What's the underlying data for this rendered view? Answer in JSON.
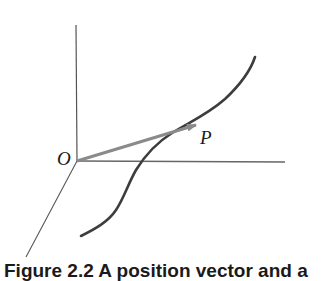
{
  "figure": {
    "origin_label": "O",
    "point_label": "P",
    "caption": "Figure 2.2 A position vector and a",
    "colors": {
      "axes": "#555555",
      "vector": "#8a8a8a",
      "curve": "#3d3d3d",
      "text": "#1a1a1a"
    },
    "elements": {
      "axes": [
        "vertical-axis",
        "horizontal-axis",
        "depth-axis"
      ],
      "vector": "position vector from O to P",
      "curve": "space curve through P"
    }
  }
}
